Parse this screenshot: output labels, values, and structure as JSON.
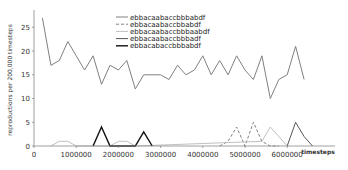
{
  "chart_data": {
    "type": "line",
    "title": "",
    "xlabel": "timesteps",
    "ylabel": "reproductions per 200,000 timesteps",
    "xlim": [
      0,
      7000000
    ],
    "ylim": [
      0,
      28
    ],
    "x_ticks": [
      0,
      1000000,
      2000000,
      3000000,
      4000000,
      5000000,
      6000000
    ],
    "x_tick_labels": [
      "0",
      "1000000",
      "2000000",
      "3000000",
      "4000000",
      "5000000",
      "6000000"
    ],
    "y_ticks": [
      0,
      5,
      10,
      15,
      20,
      25
    ],
    "y_tick_labels": [
      "0",
      "5",
      "10",
      "15",
      "20",
      "25"
    ],
    "grid": false,
    "legend_position": "top-center",
    "series": [
      {
        "name": "ebbacaabaccbbbabdf",
        "color": "#808080",
        "style": "solid",
        "x": [
          200000,
          400000,
          600000,
          800000,
          1000000,
          1200000,
          1400000,
          1600000,
          1800000,
          2000000,
          2200000,
          2400000,
          2600000,
          2800000,
          3000000,
          3200000,
          3400000,
          3600000,
          3800000,
          4000000,
          4200000,
          4400000,
          4600000,
          4800000,
          5000000,
          5200000,
          5400000,
          5600000,
          5800000,
          6000000,
          6200000,
          6400000
        ],
        "values": [
          27,
          17,
          18,
          22,
          19,
          16,
          19,
          13,
          17,
          16,
          18,
          12,
          15,
          15,
          15,
          14,
          17,
          15,
          16,
          19,
          15,
          18,
          15,
          19,
          16,
          14,
          19,
          10,
          14,
          15,
          21,
          14
        ]
      },
      {
        "name": "ebbacaabaccbbabdf",
        "color": "#808080",
        "style": "dashed",
        "x": [
          4400000,
          4600000,
          4800000,
          5000000,
          5200000,
          5400000,
          5600000,
          5800000
        ],
        "values": [
          0,
          1,
          4,
          0,
          5,
          1,
          0,
          0
        ]
      },
      {
        "name": "ebbacaabaccbbbaabdf",
        "color": "#c0c0c0",
        "style": "solid",
        "x": [
          400000,
          600000,
          800000,
          1000000,
          1800000,
          2000000,
          2200000,
          2400000,
          5400000,
          5600000,
          5800000,
          6000000
        ],
        "values": [
          0,
          1,
          1,
          0,
          0,
          1,
          1,
          0,
          1,
          4,
          2,
          0
        ]
      },
      {
        "name": "ebbacaabaccbbbadf",
        "color": "#555555",
        "style": "solid",
        "x": [
          6000000,
          6200000,
          6400000,
          6600000
        ],
        "values": [
          0,
          5,
          2,
          0
        ]
      },
      {
        "name": "ebbacabaccbbbabdf",
        "color": "#111111",
        "style": "solid",
        "x": [
          1400000,
          1600000,
          1800000,
          2400000,
          2600000,
          2800000
        ],
        "values": [
          0,
          4,
          0,
          0,
          3,
          0
        ]
      }
    ]
  },
  "legend": {
    "items": [
      {
        "label": "ebbacaabaccbbbabdf"
      },
      {
        "label": "ebbacaabaccbbabdf"
      },
      {
        "label": "ebbacaabaccbbbaabdf"
      },
      {
        "label": "ebbacaabaccbbbadf"
      },
      {
        "label": "ebbacabaccbbbabdf"
      }
    ]
  }
}
